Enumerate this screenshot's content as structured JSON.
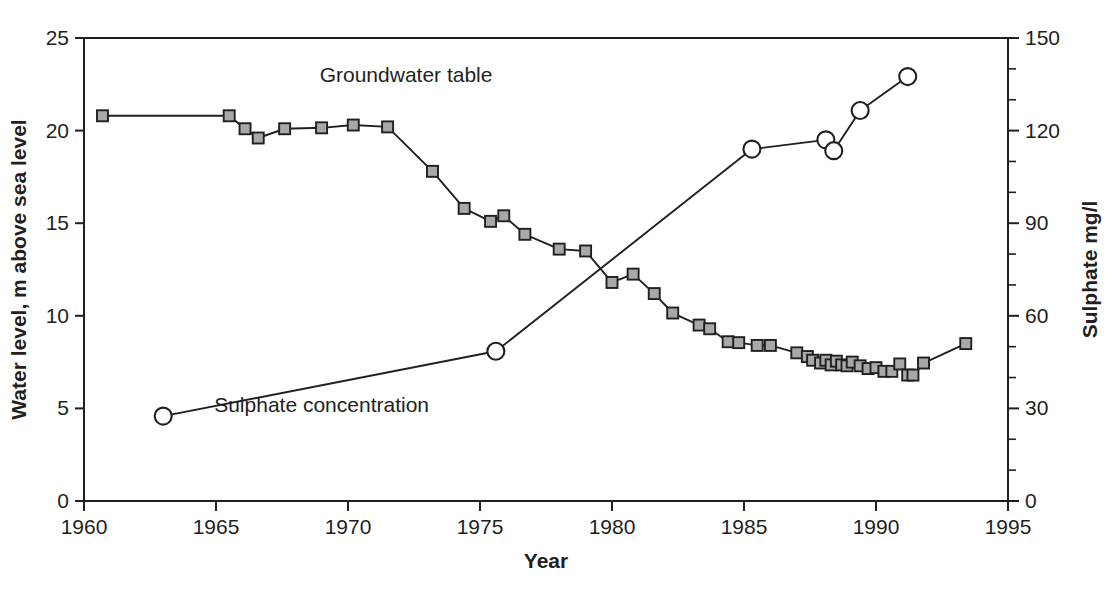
{
  "chart_data": {
    "type": "line",
    "title": "",
    "xlabel": "Year",
    "ylabel": "Water level, m above sea level",
    "y2label": "Sulphate mg/l",
    "xlim": [
      1960,
      1995
    ],
    "ylim": [
      0,
      25
    ],
    "y2lim": [
      0,
      150
    ],
    "xticks": [
      1960,
      1965,
      1970,
      1975,
      1980,
      1985,
      1990,
      1995
    ],
    "yticks": [
      0,
      5,
      10,
      15,
      20,
      25
    ],
    "y2ticks": [
      0,
      30,
      60,
      90,
      120,
      150
    ],
    "y2minorticks": [
      10,
      20,
      40,
      50,
      70,
      80,
      100,
      110,
      130,
      140
    ],
    "grid": false,
    "legend_position": "inline-annotations",
    "series": [
      {
        "name": "Groundwater table",
        "axis": "left",
        "unit": "m above sea level",
        "marker": "square",
        "marker_fill": "#a8a8a8",
        "label_x": 1972.2,
        "label_y": 22.6,
        "points": [
          [
            1960.7,
            20.8
          ],
          [
            1965.5,
            20.8
          ],
          [
            1966.1,
            20.1
          ],
          [
            1966.6,
            19.6
          ],
          [
            1967.6,
            20.1
          ],
          [
            1969.0,
            20.15
          ],
          [
            1970.2,
            20.3
          ],
          [
            1971.5,
            20.2
          ],
          [
            1973.2,
            17.8
          ],
          [
            1974.4,
            15.8
          ],
          [
            1975.4,
            15.1
          ],
          [
            1975.9,
            15.4
          ],
          [
            1976.7,
            14.4
          ],
          [
            1978.0,
            13.6
          ],
          [
            1979.0,
            13.5
          ],
          [
            1980.0,
            11.8
          ],
          [
            1980.8,
            12.25
          ],
          [
            1981.6,
            11.2
          ],
          [
            1982.3,
            10.15
          ],
          [
            1983.3,
            9.5
          ],
          [
            1983.7,
            9.3
          ],
          [
            1984.4,
            8.6
          ],
          [
            1984.8,
            8.55
          ],
          [
            1985.5,
            8.4
          ],
          [
            1986.0,
            8.4
          ],
          [
            1987.0,
            8.0
          ],
          [
            1987.4,
            7.8
          ],
          [
            1987.6,
            7.6
          ],
          [
            1987.9,
            7.45
          ],
          [
            1988.1,
            7.6
          ],
          [
            1988.3,
            7.35
          ],
          [
            1988.5,
            7.55
          ],
          [
            1988.7,
            7.35
          ],
          [
            1988.9,
            7.3
          ],
          [
            1989.1,
            7.5
          ],
          [
            1989.4,
            7.3
          ],
          [
            1989.7,
            7.15
          ],
          [
            1990.0,
            7.2
          ],
          [
            1990.3,
            7.0
          ],
          [
            1990.6,
            7.0
          ],
          [
            1990.9,
            7.4
          ],
          [
            1991.2,
            6.8
          ],
          [
            1991.4,
            6.8
          ],
          [
            1991.8,
            7.45
          ],
          [
            1993.4,
            8.5
          ]
        ]
      },
      {
        "name": "Sulphate concentration",
        "axis": "right",
        "unit": "mg/l",
        "marker": "circle",
        "marker_fill": "#ffffff",
        "label_x": 1969.0,
        "label_y": 4.8,
        "points_mgl": [
          [
            1963.0,
            27.5
          ],
          [
            1975.6,
            48.5
          ],
          [
            1985.3,
            114.0
          ],
          [
            1988.1,
            117.0
          ],
          [
            1988.4,
            113.5
          ],
          [
            1989.4,
            126.5
          ],
          [
            1991.2,
            137.5
          ]
        ]
      }
    ]
  },
  "axis_titles": {
    "x": "Year",
    "y_left": "Water level, m above sea level",
    "y_right": "Sulphate mg/l"
  },
  "annotations": {
    "groundwater": "Groundwater table",
    "sulphate": "Sulphate concentration"
  },
  "colors": {
    "ink": "#231f20",
    "marker_gray": "#a8a8a8",
    "background": "#ffffff"
  }
}
